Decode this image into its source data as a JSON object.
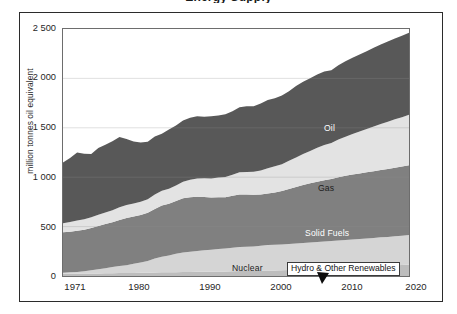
{
  "figure": {
    "title_cropped": "Energy Supply",
    "ylabel": "million tonnes oil equivalent"
  },
  "axes": {
    "y_ticks": [
      "2 500",
      "2 000",
      "1 500",
      "1 000",
      "500",
      "0"
    ],
    "x_ticks": [
      "1971",
      "1980",
      "1990",
      "2000",
      "2010",
      "2020"
    ]
  },
  "labels": {
    "oil": "Oil",
    "gas": "Gas",
    "solid_fuels": "Solid Fuels",
    "nuclear": "Nuclear",
    "renewables": "Hydro & Other Renewables"
  },
  "colors": {
    "oil": "#585858",
    "gas": "#e3e3e3",
    "solid_fuels": "#808080",
    "nuclear": "#d5d5d5",
    "renewables": "#bdbdbd",
    "frame": "#2b2b2b",
    "plot_border": "#6d6d6d",
    "gridline": "#8f8f8f",
    "background": "#ffffff"
  },
  "chart_data": {
    "type": "area",
    "title": "Energy Supply",
    "xlabel": "",
    "ylabel": "million tonnes oil equivalent",
    "xlim": [
      1971,
      2020
    ],
    "ylim": [
      0,
      2500
    ],
    "grid": true,
    "legend": "in-plot series labels",
    "stacked": true,
    "stack_order_bottom_to_top": [
      "Hydro & Other Renewables",
      "Nuclear",
      "Solid Fuels",
      "Gas",
      "Oil"
    ],
    "x": [
      1971,
      1972,
      1973,
      1974,
      1975,
      1976,
      1977,
      1978,
      1979,
      1980,
      1981,
      1982,
      1983,
      1984,
      1985,
      1986,
      1987,
      1988,
      1989,
      1990,
      1991,
      1992,
      1993,
      1994,
      1995,
      1996,
      1997,
      1998,
      1999,
      2000,
      2001,
      2002,
      2003,
      2004,
      2005,
      2006,
      2007,
      2008,
      2009,
      2010,
      2011,
      2012,
      2013,
      2014,
      2015,
      2016,
      2017,
      2018,
      2019,
      2020
    ],
    "series": [
      {
        "name": "Hydro & Other Renewables",
        "color": "#bdbdbd",
        "values": [
          22,
          23,
          23,
          25,
          26,
          26,
          27,
          29,
          30,
          30,
          31,
          32,
          34,
          36,
          37,
          38,
          39,
          40,
          40,
          42,
          43,
          44,
          45,
          46,
          48,
          50,
          50,
          51,
          53,
          55,
          56,
          58,
          60,
          62,
          65,
          68,
          71,
          74,
          77,
          81,
          84,
          87,
          90,
          94,
          97,
          101,
          104,
          108,
          112,
          116
        ]
      },
      {
        "name": "Nuclear",
        "color": "#d5d5d5",
        "values": [
          10,
          14,
          18,
          24,
          33,
          42,
          52,
          62,
          70,
          78,
          92,
          104,
          118,
          140,
          158,
          170,
          186,
          198,
          206,
          212,
          218,
          222,
          228,
          232,
          238,
          244,
          246,
          248,
          254,
          258,
          260,
          262,
          264,
          266,
          268,
          270,
          272,
          274,
          276,
          278,
          280,
          282,
          284,
          286,
          288,
          290,
          292,
          294,
          296,
          298
        ]
      },
      {
        "name": "Solid Fuels",
        "color": "#808080",
        "values": [
          410,
          412,
          418,
          420,
          428,
          438,
          448,
          452,
          466,
          478,
          478,
          482,
          488,
          502,
          518,
          524,
          534,
          548,
          552,
          548,
          538,
          528,
          524,
          520,
          526,
          530,
          528,
          524,
          518,
          522,
          530,
          540,
          556,
          572,
          588,
          600,
          612,
          622,
          628,
          640,
          650,
          658,
          664,
          670,
          676,
          682,
          688,
          694,
          700,
          706
        ]
      },
      {
        "name": "Gas",
        "color": "#e3e3e3",
        "values": [
          92,
          98,
          104,
          106,
          108,
          114,
          116,
          122,
          130,
          132,
          134,
          134,
          136,
          146,
          150,
          152,
          158,
          168,
          176,
          184,
          190,
          194,
          200,
          204,
          212,
          226,
          228,
          232,
          244,
          256,
          264,
          272,
          286,
          300,
          314,
          328,
          342,
          356,
          366,
          382,
          396,
          410,
          424,
          438,
          452,
          466,
          478,
          490,
          500,
          512
        ]
      },
      {
        "name": "Oil",
        "color": "#585858",
        "values": [
          616,
          648,
          686,
          662,
          640,
          676,
          686,
          700,
          712,
          668,
          626,
          598,
          582,
          588,
          578,
          600,
          606,
          620,
          628,
          630,
          622,
          628,
          628,
          636,
          644,
          658,
          666,
          664,
          678,
          690,
          690,
          694,
          704,
          722,
          730,
          736,
          742,
          744,
          736,
          752,
          764,
          772,
          780,
          788,
          796,
          804,
          812,
          818,
          824,
          830
        ]
      }
    ],
    "totals": [
      1150,
      1195,
      1249,
      1237,
      1235,
      1296,
      1329,
      1365,
      1408,
      1386,
      1361,
      1350,
      1358,
      1412,
      1441,
      1484,
      1523,
      1574,
      1602,
      1616,
      1611,
      1616,
      1625,
      1638,
      1668,
      1708,
      1718,
      1719,
      1747,
      1781,
      1800,
      1826,
      1870,
      1922,
      1965,
      2002,
      2039,
      2070,
      2083,
      2133,
      2174,
      2209,
      2242,
      2276,
      2309,
      2343,
      2374,
      2404,
      2432,
      2462
    ]
  }
}
